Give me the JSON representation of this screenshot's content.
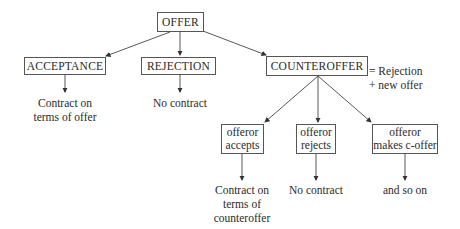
{
  "diagram": {
    "nodes": {
      "offer": "OFFER",
      "acceptance": "ACCEPTANCE",
      "rejection": "REJECTION",
      "counteroffer": "COUNTEROFFER",
      "offeror_accepts": [
        "offeror",
        "accepts"
      ],
      "offeror_rejects": [
        "offeror",
        "rejects"
      ],
      "offeror_makes_coffer": [
        "offeror",
        "makes c-offer"
      ]
    },
    "annotations": {
      "counteroffer_equals": [
        "= Rejection",
        "+ new offer"
      ]
    },
    "outcomes": {
      "acceptance": [
        "Contract on",
        "terms of offer"
      ],
      "rejection": [
        "No contract"
      ],
      "offeror_accepts": [
        "Contract on",
        "terms of",
        "counteroffer"
      ],
      "offeror_rejects": [
        "No contract"
      ],
      "offeror_makes_coffer": [
        "and so on"
      ]
    },
    "colors": {
      "line": "#444444",
      "text": "#2a2a2a"
    }
  }
}
